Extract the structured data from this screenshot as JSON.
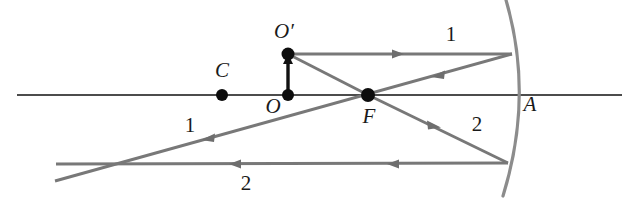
{
  "figure": {
    "background_color": "#ffffff",
    "axis_color": "#111111",
    "ray_color": "#787878",
    "mirror_color": "#8c8c8c",
    "point_color": "#0d0d0d"
  },
  "labels": {
    "center_of_curvature": "C",
    "object_base": "O",
    "object_tip": "O′",
    "focal_point": "F",
    "mirror_vertex": "A",
    "ray_one_upper": "1",
    "ray_one_lower": "1",
    "ray_two_upper": "2",
    "ray_two_lower": "2"
  },
  "label_positions": {
    "center_of_curvature": {
      "x": 222,
      "y": 77
    },
    "object_base": {
      "x": 273,
      "y": 113
    },
    "object_tip": {
      "x": 284,
      "y": 38
    },
    "focal_point": {
      "x": 369,
      "y": 123
    },
    "mirror_vertex": {
      "x": 530,
      "y": 111
    },
    "ray_one_upper": {
      "x": 451,
      "y": 41
    },
    "ray_one_lower": {
      "x": 190,
      "y": 132
    },
    "ray_two_upper": {
      "x": 477,
      "y": 131
    },
    "ray_two_lower": {
      "x": 246,
      "y": 190
    }
  },
  "geometry": {
    "optical_axis": {
      "x1": 17,
      "y1": 95,
      "x2": 622,
      "y2": 95
    },
    "mirror_arc": {
      "top_x": 506,
      "top_y": 0,
      "vertex_x": 518,
      "vertex_y": 92,
      "bottom_x": 503,
      "bottom_y": 196
    },
    "points": [
      {
        "name": "C",
        "x": 222,
        "y": 95,
        "r": 6
      },
      {
        "name": "O",
        "x": 288,
        "y": 95,
        "r": 6
      },
      {
        "name": "O-prime",
        "x": 288,
        "y": 54,
        "r": 6.5
      },
      {
        "name": "F",
        "x": 368,
        "y": 95,
        "r": 7
      }
    ],
    "object_arrow": {
      "x": 288,
      "y_base": 93,
      "y_tip": 59
    },
    "ray1_incident": {
      "x1": 288,
      "y1": 54,
      "x2": 512,
      "y2": 54,
      "arrow_x": 400,
      "arrow_y": 54
    },
    "ray1_reflected": {
      "x1": 512,
      "y1": 54,
      "x2": 55,
      "y2": 181,
      "arrow1_x": 437,
      "arrow1_y": 75,
      "arrow2_x": 205,
      "arrow2_y": 139
    },
    "ray2_incident": {
      "x1": 368,
      "y1": 95,
      "x2": 508,
      "y2": 163,
      "arrow_x": 436,
      "arrow_y": 128
    },
    "ray2_reflected": {
      "x1": 508,
      "y1": 163,
      "x2": 56,
      "y2": 164,
      "arrow1_x": 387,
      "arrow1_y": 164,
      "arrow2_x": 229,
      "arrow2_y": 164
    },
    "ray_through_F_upper": {
      "x1": 288,
      "y1": 54,
      "x2": 368,
      "y2": 95
    }
  }
}
